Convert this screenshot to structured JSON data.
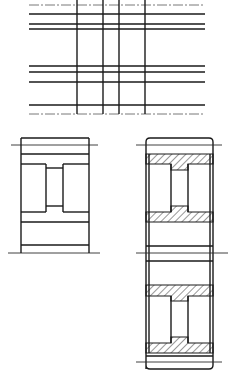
{
  "canvas": {
    "width": 237,
    "height": 372,
    "background": "#ffffff",
    "stroke": "#1a1a1a"
  },
  "views": [
    {
      "name": "grid-view",
      "description": "Intersecting horizontal and vertical lines (layout lines)",
      "horizontal_lines_y": [
        14,
        24,
        29,
        66,
        72,
        82,
        105
      ],
      "centerlines_y": [
        5,
        114
      ],
      "vertical_lines_x": [
        77,
        103,
        119,
        145
      ],
      "x_extent": [
        29,
        205
      ]
    },
    {
      "name": "plain-section-view",
      "description": "Single gear/bushing outline, unhatched",
      "outer": [
        21,
        138,
        89,
        253
      ]
    },
    {
      "name": "hatched-section-view",
      "description": "Two stacked hatched cross-sections with rounded outer housing",
      "outer": [
        146,
        138,
        213,
        369
      ]
    }
  ]
}
